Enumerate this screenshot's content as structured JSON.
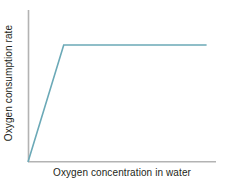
{
  "figure": {
    "background_color": "#ffffff",
    "axis_color": "#b3b3b3",
    "text_color": "#231f20"
  },
  "axes": {
    "y_title": "Oxygen consumption rate",
    "x_title": "Oxygen concentration in water"
  },
  "chart_data": {
    "type": "line",
    "title": "",
    "subtitle": "",
    "xlabel": "Oxygen concentration in water",
    "ylabel": "Oxygen consumption rate",
    "xlim": [
      0,
      100
    ],
    "ylim": [
      0,
      100
    ],
    "x_ticks": [],
    "y_ticks": [],
    "x_tick_labels": [],
    "y_tick_labels": [],
    "grid": false,
    "legend": false,
    "legend_position": "none",
    "annotations": [],
    "series": [
      {
        "name": "Oxygen consumption rate",
        "color": "#6ba9b7",
        "line_width": 1.6,
        "x": [
          0,
          19,
          95
        ],
        "y": [
          0,
          77,
          77
        ],
        "description": "Rate rises linearly with oxygen concentration, then plateaus at a maximum above a breakpoint concentration"
      }
    ],
    "breakpoint": {
      "x": 19,
      "y": 77
    },
    "plateau_value": 77
  }
}
